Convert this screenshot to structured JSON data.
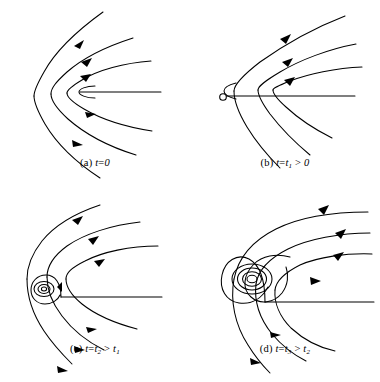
{
  "figure": {
    "type": "streamline-evolution-diagram",
    "background": "#ffffff",
    "stroke_color": "#000000",
    "panel_count": 4,
    "layout": "2x2 grid",
    "width": 380,
    "height": 382
  },
  "panels": [
    {
      "id": "a",
      "label": "(a)",
      "time_var": "t",
      "equals": "=",
      "time_value": "0",
      "caption_plain": "(a) t=0",
      "feature": "cusp, no closed streamline",
      "stagnation_marker": "none",
      "vortex_loops": 0,
      "streamline_count": 7,
      "arrow_count": 5,
      "flow_direction": "leftward (inflow toward cusp)"
    },
    {
      "id": "b",
      "label": "(b)",
      "time_var": "t",
      "equals": "=",
      "time_value": "t",
      "time_sub": "1",
      "relation": ">",
      "compare_value": "0",
      "caption_plain": "(b) t=t1 > 0",
      "feature": "separation point appears",
      "stagnation_marker": "open-circle",
      "vortex_loops": 0,
      "streamline_count": 7,
      "arrow_count": 3,
      "flow_direction": "leftward (inflow toward separation point)"
    },
    {
      "id": "c",
      "label": "(c)",
      "time_var": "t",
      "equals": "=",
      "time_value": "t",
      "time_sub": "2",
      "relation": ">",
      "compare_value": "t",
      "compare_sub": "1",
      "caption_plain": "(c) t=t2 > t1",
      "feature": "small vortex forms",
      "stagnation_marker": "none",
      "vortex_loops": 3,
      "streamline_count": 7,
      "arrow_count": 6,
      "flow_direction": "leftward outer flow, closed recirculation core"
    },
    {
      "id": "d",
      "label": "(d)",
      "time_var": "t",
      "equals": "=",
      "time_value": "t",
      "time_sub": "3",
      "relation": ">",
      "compare_value": "t",
      "compare_sub": "2",
      "caption_plain": "(d) t=t3 > t2",
      "feature": "large developed vortex",
      "stagnation_marker": "none",
      "vortex_loops": 6,
      "streamline_count": 7,
      "arrow_count": 6,
      "flow_direction": "leftward outer flow, large closed recirculation core"
    }
  ]
}
